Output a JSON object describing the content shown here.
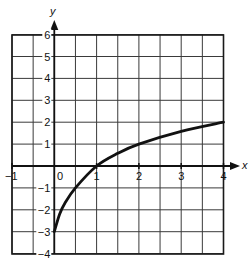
{
  "chart_data": {
    "type": "line",
    "title": "",
    "xlabel": "x",
    "ylabel": "y",
    "xlim": [
      -1,
      4
    ],
    "ylim": [
      -4,
      6
    ],
    "grid": true,
    "grid_step_x": 0.5,
    "grid_step_y": 1,
    "x_tick_labels": [
      "-1",
      "0",
      "1",
      "2",
      "3",
      "4"
    ],
    "y_tick_labels": [
      "-4",
      "-3",
      "-2",
      "-1",
      "1",
      "2",
      "3",
      "4",
      "5",
      "6"
    ],
    "series": [
      {
        "name": "curve",
        "x": [
          0,
          0.125,
          0.25,
          0.5,
          1,
          1.5,
          2,
          3,
          4
        ],
        "y": [
          -3,
          -2.2,
          -1.7,
          -1,
          0,
          0.58,
          1,
          1.58,
          2
        ]
      }
    ],
    "colors": {
      "curve": "#111111",
      "grid": "#3a3a3a"
    }
  },
  "labels": {
    "x_axis": "x",
    "y_axis": "y",
    "origin": "0",
    "x_ticks": [
      "−1",
      "1",
      "2",
      "3",
      "4"
    ],
    "y_ticks": [
      "6",
      "5",
      "4",
      "3",
      "2",
      "1",
      "−1",
      "−2",
      "−3",
      "−4"
    ]
  }
}
